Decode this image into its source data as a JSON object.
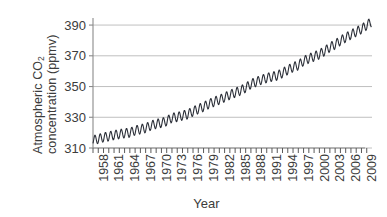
{
  "chart_data": {
    "type": "line",
    "title": "",
    "xlabel": "Year",
    "ylabel_line1": "Atmospheric CO",
    "ylabel_sub": "2",
    "ylabel_line2": "concentration (ppmv)",
    "ylabel_full": "Atmospheric CO2 concentration (ppmv)",
    "xlim": [
      1958,
      2011
    ],
    "ylim": [
      310,
      392
    ],
    "yticks": [
      310,
      330,
      350,
      370,
      390
    ],
    "ytick_labels": [
      "310",
      "330",
      "350",
      "370",
      "390"
    ],
    "xticks": [
      1958,
      1961,
      1964,
      1967,
      1970,
      1973,
      1976,
      1979,
      1982,
      1985,
      1988,
      1991,
      1994,
      1997,
      2000,
      2003,
      2006,
      2009
    ],
    "xtick_labels": [
      "1958",
      "1961",
      "1964",
      "1967",
      "1970",
      "1973",
      "1976",
      "1979",
      "1982",
      "1985",
      "1988",
      "1991",
      "1994",
      "1997",
      "2000",
      "2003",
      "2006",
      "2009"
    ],
    "xtick_minor_step": 1,
    "grid": "horizontal",
    "legend": "none",
    "line_color": "#2b2f38",
    "grid_color": "#b9b9b9",
    "axis_color": "#8a8a8a",
    "background_color": "#ffffff",
    "seasonal_amplitude_ppmv": 3.0,
    "series": [
      {
        "name": "Mauna Loa annual mean CO2",
        "x": [
          1958,
          1959,
          1960,
          1961,
          1962,
          1963,
          1964,
          1965,
          1966,
          1967,
          1968,
          1969,
          1970,
          1971,
          1972,
          1973,
          1974,
          1975,
          1976,
          1977,
          1978,
          1979,
          1980,
          1981,
          1982,
          1983,
          1984,
          1985,
          1986,
          1987,
          1988,
          1989,
          1990,
          1991,
          1992,
          1993,
          1994,
          1995,
          1996,
          1997,
          1998,
          1999,
          2000,
          2001,
          2002,
          2003,
          2004,
          2005,
          2006,
          2007,
          2008,
          2009,
          2010
        ],
        "values": [
          315.0,
          315.9,
          316.9,
          317.6,
          318.4,
          319.0,
          319.6,
          320.0,
          321.4,
          322.2,
          323.0,
          324.6,
          325.7,
          326.3,
          327.5,
          329.7,
          330.2,
          331.1,
          332.0,
          333.8,
          335.4,
          336.8,
          338.7,
          340.1,
          341.4,
          343.0,
          344.6,
          346.0,
          347.4,
          349.2,
          351.6,
          353.1,
          354.4,
          355.6,
          356.4,
          357.1,
          358.8,
          360.8,
          362.6,
          363.8,
          366.6,
          368.3,
          369.5,
          371.0,
          373.1,
          375.6,
          377.4,
          379.8,
          381.9,
          383.8,
          385.6,
          387.4,
          389.9
        ]
      }
    ]
  },
  "axis": {
    "y_title_line1": "Atmospheric CO",
    "y_title_sub": "2",
    "y_title_line2": "concentration (ppmv)",
    "x_title": "Year"
  }
}
